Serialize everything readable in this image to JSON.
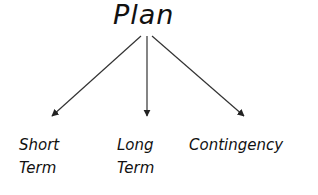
{
  "diagram": {
    "root": {
      "label": "Plan"
    },
    "children": [
      {
        "line1": "Short",
        "line2": "Term"
      },
      {
        "line1": "Long",
        "line2": "Term"
      },
      {
        "line1": "Contingency",
        "line2": ""
      }
    ],
    "colors": {
      "ink": "#111111",
      "arrow": "#333333",
      "background": "#ffffff"
    }
  }
}
